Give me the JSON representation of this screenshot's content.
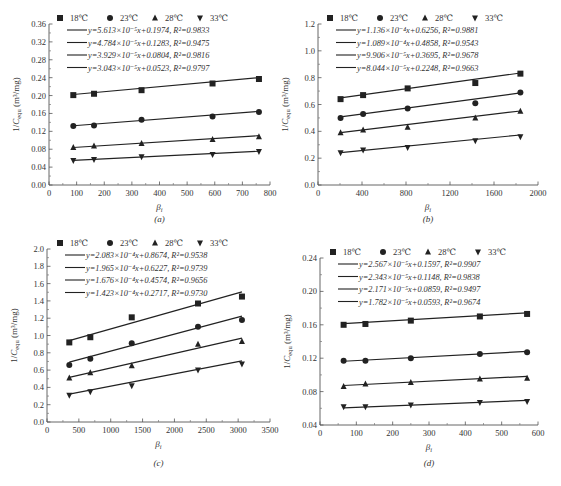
{
  "figure": {
    "legend_labels": [
      "18℃",
      "23℃",
      "28℃",
      "33℃"
    ],
    "marker_icons": [
      "square-marker-icon",
      "circle-marker-icon",
      "triangle-up-marker-icon",
      "triangle-down-marker-icon"
    ],
    "x_label": "βi",
    "y_label": "1/Cequ (m³/mg)",
    "line_color": "#222222"
  },
  "chart_data": [
    {
      "type": "scatter",
      "panel": "(a)",
      "caption": "(a)",
      "xlabel": "β_i",
      "ylabel": "1/C_equ (m³/mg)",
      "xlim": [
        0,
        800
      ],
      "ylim": [
        0.0,
        0.36
      ],
      "xticks": [
        0,
        100,
        200,
        300,
        400,
        500,
        600,
        700,
        800
      ],
      "yticks": [
        0.0,
        0.04,
        0.08,
        0.12,
        0.16,
        0.2,
        0.24,
        0.28,
        0.32,
        0.36
      ],
      "ytick_decimals": 2,
      "grid": false,
      "legend_position": "top",
      "x": [
        88,
        163,
        335,
        592,
        760
      ],
      "series": [
        {
          "name": "18℃",
          "marker": "square",
          "values": [
            0.201,
            0.204,
            0.212,
            0.227,
            0.237
          ],
          "fit": "y=5.613×10⁻⁵x+0.1974, R²=0.9833",
          "slope": 5.613e-05,
          "intercept": 0.1974
        },
        {
          "name": "23℃",
          "marker": "circle",
          "values": [
            0.132,
            0.133,
            0.146,
            0.153,
            0.163
          ],
          "fit": "y=4.784×10⁻⁵x+0.1283, R²=0.9475",
          "slope": 4.784e-05,
          "intercept": 0.1283
        },
        {
          "name": "28℃",
          "marker": "triangle-up",
          "values": [
            0.084,
            0.087,
            0.093,
            0.102,
            0.108
          ],
          "fit": "y=3.929×10⁻⁵x+0.0804, R²=0.9816",
          "slope": 3.929e-05,
          "intercept": 0.0804
        },
        {
          "name": "33℃",
          "marker": "triangle-down",
          "values": [
            0.055,
            0.057,
            0.063,
            0.068,
            0.075
          ],
          "fit": "y=3.043×10⁻⁵x+0.0523, R²=0.9797",
          "slope": 3.043e-05,
          "intercept": 0.0523
        }
      ]
    },
    {
      "type": "scatter",
      "panel": "(b)",
      "caption": "(b)",
      "xlabel": "β_i",
      "ylabel": "1/C_equ (m³/mg)",
      "xlim": [
        0,
        2000
      ],
      "ylim": [
        0.0,
        1.2
      ],
      "xticks": [
        0,
        400,
        800,
        1200,
        1600,
        2000
      ],
      "yticks": [
        0.0,
        0.2,
        0.4,
        0.6,
        0.8,
        1.0,
        1.2
      ],
      "ytick_decimals": 1,
      "grid": false,
      "legend_position": "top",
      "x": [
        205,
        410,
        815,
        1430,
        1840
      ],
      "series": [
        {
          "name": "18℃",
          "marker": "square",
          "values": [
            0.64,
            0.67,
            0.72,
            0.76,
            0.83
          ],
          "fit": "y=1.136×10⁻⁴x+0.6256, R²=0.9881",
          "slope": 0.0001136,
          "intercept": 0.6256
        },
        {
          "name": "23℃",
          "marker": "circle",
          "values": [
            0.5,
            0.53,
            0.57,
            0.61,
            0.69
          ],
          "fit": "y=1.089×10⁻⁴x+0.4858, R²=0.9543",
          "slope": 0.0001089,
          "intercept": 0.4858
        },
        {
          "name": "28℃",
          "marker": "triangle-up",
          "values": [
            0.39,
            0.41,
            0.43,
            0.5,
            0.55
          ],
          "fit": "y=9.906×10⁻⁵x+0.3695, R²=0.9678",
          "slope": 9.906e-05,
          "intercept": 0.3695
        },
        {
          "name": "33℃",
          "marker": "triangle-down",
          "values": [
            0.24,
            0.26,
            0.28,
            0.33,
            0.36
          ],
          "fit": "y=8.044×10⁻⁵x+0.2248, R²=0.9663",
          "slope": 8.044e-05,
          "intercept": 0.2248
        }
      ]
    },
    {
      "type": "scatter",
      "panel": "(c)",
      "caption": "(c)",
      "xlabel": "β_i",
      "ylabel": "1/C_equ (m³/mg)",
      "xlim": [
        0,
        3500
      ],
      "ylim": [
        0.0,
        2.0
      ],
      "xticks": [
        0,
        500,
        1000,
        1500,
        2000,
        2500,
        3000,
        3500
      ],
      "yticks": [
        0.0,
        0.2,
        0.4,
        0.6,
        0.8,
        1.0,
        1.2,
        1.4,
        1.6,
        1.8,
        2.0
      ],
      "ytick_decimals": 1,
      "grid": false,
      "legend_position": "top",
      "x": [
        350,
        680,
        1330,
        2370,
        3060
      ],
      "series": [
        {
          "name": "18℃",
          "marker": "square",
          "values": [
            0.92,
            0.98,
            1.21,
            1.37,
            1.45
          ],
          "fit": "y=2.083×10⁻⁴x+0.8674, R²=0.9538",
          "slope": 0.0002083,
          "intercept": 0.8674
        },
        {
          "name": "23℃",
          "marker": "circle",
          "values": [
            0.66,
            0.73,
            0.91,
            1.1,
            1.18
          ],
          "fit": "y=1.965×10⁻⁴x+0.6227, R²=0.9739",
          "slope": 0.0001965,
          "intercept": 0.6227
        },
        {
          "name": "28℃",
          "marker": "triangle-up",
          "values": [
            0.51,
            0.57,
            0.65,
            0.9,
            0.93
          ],
          "fit": "y=1.676×10⁻⁴x+0.4574, R²=0.9656",
          "slope": 0.0001676,
          "intercept": 0.4574
        },
        {
          "name": "33℃",
          "marker": "triangle-down",
          "values": [
            0.31,
            0.35,
            0.42,
            0.6,
            0.67
          ],
          "fit": "y=1.423×10⁻⁴x+0.2717, R²=0.9730",
          "slope": 0.0001423,
          "intercept": 0.2717
        }
      ]
    },
    {
      "type": "scatter",
      "panel": "(d)",
      "caption": "(d)",
      "xlabel": "β_i",
      "ylabel": "1/C_equ (m³/mg)",
      "xlim": [
        0,
        600
      ],
      "ylim": [
        0.04,
        0.24
      ],
      "xticks": [
        0,
        100,
        200,
        300,
        400,
        500,
        600
      ],
      "yticks": [
        0.04,
        0.08,
        0.12,
        0.16,
        0.2,
        0.24
      ],
      "ytick_decimals": 2,
      "grid": false,
      "legend_position": "top",
      "x": [
        65,
        125,
        250,
        440,
        570
      ],
      "series": [
        {
          "name": "18℃",
          "marker": "square",
          "values": [
            0.16,
            0.161,
            0.165,
            0.17,
            0.173
          ],
          "fit": "y=2.567×10⁻⁵x+0.1597, R²=0.9907",
          "slope": 2.567e-05,
          "intercept": 0.1597
        },
        {
          "name": "23℃",
          "marker": "circle",
          "values": [
            0.117,
            0.117,
            0.12,
            0.125,
            0.127
          ],
          "fit": "y=2.343×10⁻⁵x+0.1148, R²=0.9838",
          "slope": 2.343e-05,
          "intercept": 0.1148
        },
        {
          "name": "28℃",
          "marker": "triangle-up",
          "values": [
            0.086,
            0.089,
            0.091,
            0.095,
            0.096
          ],
          "fit": "y=2.171×10⁻⁵x+0.0859, R²=0.9497",
          "slope": 2.171e-05,
          "intercept": 0.0859
        },
        {
          "name": "33℃",
          "marker": "triangle-down",
          "values": [
            0.062,
            0.062,
            0.064,
            0.067,
            0.068
          ],
          "fit": "y=1.782×10⁻⁵x+0.0593, R²=0.9674",
          "slope": 1.782e-05,
          "intercept": 0.0593
        }
      ]
    }
  ]
}
